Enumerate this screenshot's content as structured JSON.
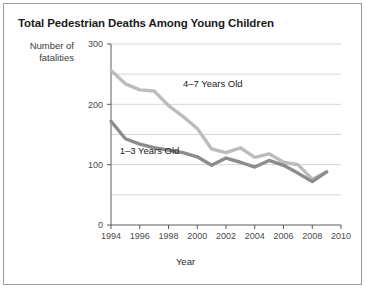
{
  "figure": {
    "title": "Total Pedestrian Deaths Among Young Children",
    "y_axis_title_line1": "Number of",
    "y_axis_title_line2": "fatalities",
    "x_axis_title": "Year"
  },
  "chart_data": {
    "type": "line",
    "title": "Total Pedestrian Deaths Among Young Children",
    "xlabel": "Year",
    "ylabel": "Number of fatalities",
    "xlim": [
      1994,
      2010
    ],
    "ylim": [
      0,
      300
    ],
    "xticks": [
      1994,
      1996,
      1998,
      2000,
      2002,
      2004,
      2006,
      2008,
      2010
    ],
    "xtick_labels": [
      "1994",
      "1996",
      "1998",
      "2000",
      "2002",
      "2004",
      "2006",
      "2008",
      "2010"
    ],
    "yticks": [
      0,
      100,
      200,
      300
    ],
    "ytick_labels": [
      "0",
      "100",
      "200",
      "300"
    ],
    "gridlines_y": [
      50,
      100,
      150,
      200,
      250,
      300
    ],
    "grid": true,
    "legend_position": "inline-annotations",
    "x": [
      1994,
      1995,
      1996,
      1997,
      1998,
      1999,
      2000,
      2001,
      2002,
      2003,
      2004,
      2005,
      2006,
      2007,
      2008,
      2009
    ],
    "series": [
      {
        "name": "4–7 Years Old",
        "color": "#bdbdbd",
        "label_x": 1999,
        "label_y": 228,
        "values": [
          256,
          234,
          224,
          222,
          198,
          180,
          160,
          126,
          120,
          128,
          112,
          118,
          104,
          100,
          76,
          88
        ]
      },
      {
        "name": "1–3 Years Old",
        "color": "#8c8c8c",
        "label_x": 1994.6,
        "label_y": 118,
        "values": [
          172,
          143,
          134,
          128,
          124,
          120,
          113,
          99,
          111,
          104,
          96,
          107,
          99,
          86,
          72,
          88
        ]
      }
    ]
  }
}
